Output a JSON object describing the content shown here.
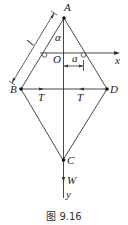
{
  "figure": {
    "caption": "图 9.16",
    "points": {
      "A": "A",
      "B": "B",
      "C": "C",
      "D": "D",
      "O": "O"
    },
    "labels": {
      "length": "l",
      "angle": "α",
      "offset": "a",
      "tension_left": "T",
      "tension_right": "T",
      "weight": "W",
      "x_axis": "x",
      "y_axis": "y"
    },
    "colors": {
      "line": "#333333",
      "text": "#222222"
    }
  }
}
